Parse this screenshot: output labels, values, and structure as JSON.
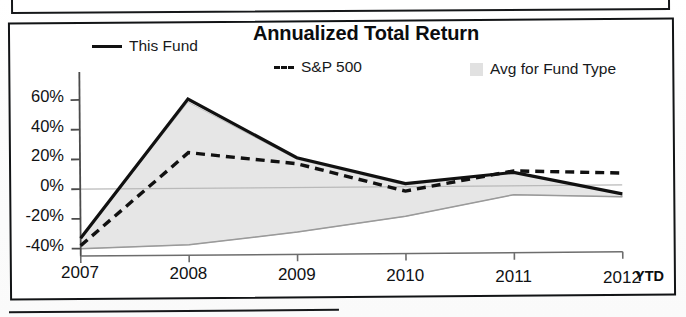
{
  "document": {
    "frame_present": true,
    "top_fragment_present": true,
    "bottom_fragment_present": true
  },
  "chart_data": {
    "type": "line",
    "title": "Annualized Total Return",
    "xlabel": "",
    "ylabel": "",
    "x_suffix_label": "YTD",
    "categories": [
      "2007",
      "2008",
      "2009",
      "2010",
      "2011",
      "2012"
    ],
    "ytick_labels": [
      "60%",
      "40%",
      "20%",
      "0%",
      "-20%",
      "-40%"
    ],
    "ytick_values": [
      60,
      40,
      20,
      0,
      -20,
      -40
    ],
    "ylim": [
      -45,
      68
    ],
    "grid": false,
    "zero_line": true,
    "legend_position": "top",
    "series": [
      {
        "name": "This Fund",
        "style": "solid",
        "color": "#111111",
        "values": [
          -33,
          60,
          20,
          2,
          9,
          -6
        ]
      },
      {
        "name": "S&P 500",
        "style": "dashed",
        "color": "#111111",
        "values": [
          -38,
          24,
          16,
          -3,
          10,
          8
        ]
      },
      {
        "name": "Avg for Fund Type",
        "style": "area",
        "color": "#d7d7d7",
        "upper": [
          -33,
          58,
          19,
          1,
          9,
          -6
        ],
        "lower": [
          -40,
          -38,
          -30,
          -20,
          -6,
          -8
        ]
      }
    ]
  },
  "legend": {
    "items": [
      {
        "label": "This Fund",
        "swatch": "solid-line-swatch"
      },
      {
        "label": "--- S&P 500",
        "swatch": "dashed-line-swatch"
      },
      {
        "label": "Avg for Fund Type",
        "swatch": "area-fill-swatch"
      }
    ]
  },
  "axes": {
    "y": {
      "labels": [
        "60%",
        "40%",
        "20%",
        "0%",
        "-20%",
        "-40%"
      ]
    },
    "x": {
      "labels": [
        "2007",
        "2008",
        "2009",
        "2010",
        "2011",
        "2012"
      ],
      "suffix": "YTD"
    }
  }
}
